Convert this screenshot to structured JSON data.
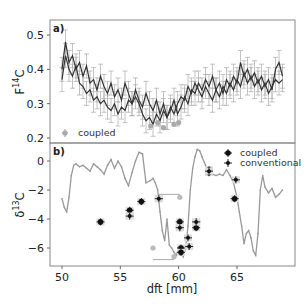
{
  "chart_data": [
    {
      "panel": "a)",
      "type": "line",
      "title": "",
      "xlabel": "dft [mm]",
      "ylabel": "F14C",
      "ylabel_main": "F",
      "ylabel_sup": "14",
      "ylabel_tail": "C",
      "xlim": [
        49.3,
        69.6
      ],
      "ylim": [
        0.19,
        0.54
      ],
      "yticks": [
        0.2,
        0.3,
        0.4,
        0.5
      ],
      "ytick_labels": [
        "0.2",
        "0.3",
        "0.4",
        "0.5"
      ],
      "legend": [
        {
          "label": "coupled",
          "marker": "gray circle with errorbar"
        }
      ],
      "legend_position": "lower left",
      "series": [
        {
          "name": "coupled",
          "color": "#333333",
          "errorbar": 0.035,
          "x": [
            50.0,
            50.3,
            50.6,
            50.9,
            51.2,
            51.5,
            51.8,
            52.1,
            52.4,
            52.7,
            53.0,
            53.3,
            53.6,
            53.9,
            54.2,
            54.5,
            54.8,
            55.1,
            55.4,
            55.7,
            56.0,
            56.3,
            56.6,
            56.9,
            57.2,
            57.5,
            57.8,
            58.1,
            58.4,
            58.7,
            59.0,
            59.3,
            59.6,
            59.9,
            60.2,
            60.5,
            60.8,
            61.1,
            61.4,
            61.7,
            62.0,
            62.3,
            62.6,
            62.9,
            63.2,
            63.5,
            63.8,
            64.1,
            64.4,
            64.7,
            65.0,
            65.3,
            65.6,
            65.9,
            66.2,
            66.5,
            66.8,
            67.1,
            67.4,
            67.7,
            68.0,
            68.3,
            68.6,
            68.9
          ],
          "y": [
            0.4,
            0.48,
            0.42,
            0.44,
            0.4,
            0.42,
            0.38,
            0.41,
            0.36,
            0.37,
            0.34,
            0.38,
            0.35,
            0.33,
            0.36,
            0.32,
            0.34,
            0.31,
            0.36,
            0.33,
            0.3,
            0.34,
            0.31,
            0.29,
            0.33,
            0.3,
            0.28,
            0.31,
            0.27,
            0.3,
            0.26,
            0.28,
            0.31,
            0.27,
            0.29,
            0.32,
            0.3,
            0.34,
            0.33,
            0.36,
            0.34,
            0.37,
            0.35,
            0.38,
            0.34,
            0.36,
            0.33,
            0.37,
            0.35,
            0.38,
            0.36,
            0.42,
            0.38,
            0.4,
            0.37,
            0.39,
            0.36,
            0.38,
            0.35,
            0.37,
            0.34,
            0.4,
            0.42,
            0.38
          ]
        },
        {
          "name": "coupled-lower",
          "color": "#333333",
          "errorbar": 0.035,
          "x": [
            50.0,
            50.3,
            50.6,
            50.9,
            51.2,
            51.5,
            51.8,
            52.1,
            52.4,
            52.7,
            53.0,
            53.3,
            53.6,
            53.9,
            54.2,
            54.5,
            54.8,
            55.1,
            55.4,
            55.7,
            56.0,
            56.3,
            56.6,
            56.9,
            57.2,
            57.5,
            57.8,
            58.1,
            58.4,
            58.7,
            59.0,
            59.3,
            59.6,
            59.9,
            60.2,
            60.5,
            60.8,
            61.1,
            61.4,
            61.7,
            62.0,
            62.3,
            62.6,
            62.9,
            63.2,
            63.5,
            63.8,
            64.1,
            64.4,
            64.7,
            65.0,
            65.3,
            65.6,
            65.9,
            66.2,
            66.5,
            66.8,
            67.1,
            67.4,
            67.7,
            68.0,
            68.3,
            68.6,
            68.9
          ],
          "y": [
            0.37,
            0.44,
            0.4,
            0.38,
            0.41,
            0.36,
            0.35,
            0.33,
            0.34,
            0.31,
            0.32,
            0.3,
            0.31,
            0.29,
            0.28,
            0.3,
            0.27,
            0.29,
            0.28,
            0.31,
            0.3,
            0.32,
            0.3,
            0.27,
            0.25,
            0.26,
            0.24,
            0.27,
            0.25,
            0.28,
            0.26,
            0.29,
            0.27,
            0.3,
            0.32,
            0.31,
            0.35,
            0.33,
            0.36,
            0.34,
            0.32,
            0.35,
            0.33,
            0.31,
            0.34,
            0.32,
            0.35,
            0.33,
            0.36,
            0.34,
            0.37,
            0.35,
            0.39,
            0.36,
            0.38,
            0.35,
            0.37,
            0.34,
            0.36,
            0.33,
            0.35,
            0.37,
            0.36,
            0.37
          ]
        }
      ],
      "gray_points": {
        "x": [
          57.6,
          58.2,
          58.7,
          59.6,
          60.0
        ],
        "y": [
          0.235,
          0.245,
          0.23,
          0.24,
          0.245
        ]
      }
    },
    {
      "panel": "b)",
      "type": "line",
      "xlabel": "dft [mm]",
      "ylabel": "δ13C",
      "ylabel_main": "δ",
      "ylabel_sup": "13",
      "ylabel_tail": "C",
      "xlim": [
        49.3,
        69.6
      ],
      "ylim": [
        -7.3,
        1.2
      ],
      "xticks": [
        50,
        55,
        60,
        65
      ],
      "xtick_labels": [
        "50",
        "55",
        "60",
        "65"
      ],
      "yticks": [
        0,
        -2,
        -4,
        -6
      ],
      "ytick_labels": [
        "0",
        "−2",
        "−4",
        "−6"
      ],
      "legend": [
        {
          "label": "coupled",
          "marker": "black circle with errorbar"
        },
        {
          "label": "conventional",
          "marker": "black small dot with errorbar"
        }
      ],
      "legend_position": "upper right",
      "series": [
        {
          "name": "profile",
          "color": "#999999",
          "x": [
            50.0,
            50.2,
            50.4,
            50.6,
            50.8,
            51.0,
            51.2,
            51.5,
            51.8,
            52.1,
            52.4,
            52.7,
            53.0,
            53.3,
            53.6,
            53.9,
            54.2,
            54.5,
            54.8,
            55.1,
            55.4,
            55.7,
            56.0,
            56.3,
            56.6,
            56.9,
            57.2,
            57.5,
            57.8,
            58.0,
            58.2,
            58.4,
            58.6,
            58.8,
            59.0,
            59.2,
            59.4,
            59.6,
            59.8,
            60.0,
            60.2,
            60.4,
            60.6,
            60.8,
            61.0,
            61.2,
            61.4,
            61.6,
            61.8,
            62.0,
            62.3,
            62.6,
            62.9,
            63.2,
            63.5,
            63.8,
            64.1,
            64.4,
            64.7,
            65.0,
            65.2,
            65.4,
            65.6,
            65.8,
            66.0,
            66.2,
            66.4,
            66.6,
            66.8,
            67.0,
            67.2,
            67.4,
            67.7,
            68.0,
            68.3,
            68.6,
            68.9
          ],
          "y": [
            -2.6,
            -3.2,
            -3.5,
            -2.5,
            -1.0,
            -0.3,
            -0.2,
            -0.4,
            -0.3,
            -0.5,
            -0.7,
            -0.2,
            -0.4,
            -0.6,
            -0.9,
            -0.3,
            0.1,
            -0.5,
            0.0,
            -0.4,
            -1.2,
            -1.7,
            -0.8,
            0.0,
            0.6,
            0.5,
            -1.5,
            -1.4,
            -1.2,
            -1.5,
            -2.0,
            -3.5,
            -4.8,
            -5.5,
            -4.0,
            -5.8,
            -6.0,
            -6.3,
            -6.5,
            -6.0,
            -6.3,
            -6.6,
            -6.0,
            -4.5,
            -2.0,
            -0.5,
            0.3,
            0.8,
            0.7,
            0.3,
            -0.3,
            -1.0,
            -0.9,
            -1.0,
            -0.9,
            -1.0,
            -0.6,
            -1.0,
            -1.5,
            -2.5,
            -3.5,
            -4.5,
            -5.7,
            -5.0,
            -4.8,
            -5.3,
            -6.2,
            -6.5,
            -5.0,
            -2.0,
            -1.0,
            -1.8,
            -2.2,
            -1.9,
            -2.5,
            -2.3,
            -2.0
          ]
        }
      ],
      "coupled_points": {
        "x": [
          53.3,
          55.8,
          56.8,
          58.3,
          60.1,
          60.1,
          60.2,
          60.2,
          61.5,
          61.5,
          62.6,
          62.6,
          64.8
        ],
        "y": [
          -4.2,
          -3.4,
          -2.8,
          -2.6,
          -4.2,
          -4.6,
          -6.0,
          -6.3,
          -4.2,
          -4.6,
          -0.6,
          -0.8,
          -2.6
        ]
      },
      "conventional_points": {
        "x": [
          55.8,
          58.3,
          60.1,
          60.9,
          60.8,
          61.5,
          62.6,
          64.9
        ],
        "y": [
          -3.8,
          -2.6,
          -4.6,
          -5.9,
          -5.3,
          -4.2,
          -0.7,
          -1.3
        ]
      },
      "gray_points": {
        "x": [
          57.8,
          60.1,
          59.6
        ],
        "y": [
          -6.0,
          -2.5,
          -6.6
        ]
      },
      "gray_hlines": [
        {
          "x1": 58.3,
          "x2": 60.1,
          "y": -2.3
        },
        {
          "x1": 57.8,
          "x2": 59.6,
          "y": -6.8
        }
      ]
    }
  ],
  "labels": {
    "panel_a": "a)",
    "panel_b": "b)",
    "xlabel": "dft [mm]",
    "legend_a_coupled": "coupled",
    "legend_b_coupled": "coupled",
    "legend_b_conventional": "conventional"
  }
}
